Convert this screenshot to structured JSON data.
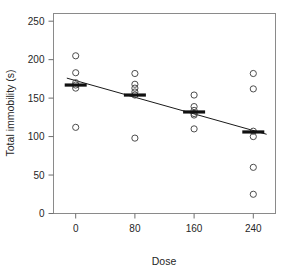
{
  "chart_data": {
    "type": "scatter",
    "title": "",
    "xlabel": "Dose",
    "ylabel": "Total immobility (s)",
    "xlim": [
      -30,
      270
    ],
    "ylim": [
      0,
      260
    ],
    "xticks": [
      0,
      80,
      160,
      240
    ],
    "yticks": [
      0,
      50,
      100,
      150,
      200,
      250
    ],
    "xtick_labels": [
      "0",
      "80",
      "160",
      "240"
    ],
    "ytick_labels": [
      "0",
      "50",
      "100",
      "150",
      "200",
      "250"
    ],
    "grid": false,
    "legend": false,
    "frame": "box",
    "categories": [
      0,
      80,
      160,
      240
    ],
    "series": [
      {
        "name": "Total immobility observations",
        "marker": "open-circle",
        "points": [
          {
            "x": 0,
            "y": 205
          },
          {
            "x": 0,
            "y": 183
          },
          {
            "x": 0,
            "y": 170
          },
          {
            "x": 0,
            "y": 167
          },
          {
            "x": 0,
            "y": 163
          },
          {
            "x": 0,
            "y": 112
          },
          {
            "x": 80,
            "y": 182
          },
          {
            "x": 80,
            "y": 168
          },
          {
            "x": 80,
            "y": 163
          },
          {
            "x": 80,
            "y": 158
          },
          {
            "x": 80,
            "y": 154
          },
          {
            "x": 80,
            "y": 98
          },
          {
            "x": 160,
            "y": 154
          },
          {
            "x": 160,
            "y": 139
          },
          {
            "x": 160,
            "y": 134
          },
          {
            "x": 160,
            "y": 130
          },
          {
            "x": 160,
            "y": 128
          },
          {
            "x": 160,
            "y": 110
          },
          {
            "x": 240,
            "y": 182
          },
          {
            "x": 240,
            "y": 162
          },
          {
            "x": 240,
            "y": 107
          },
          {
            "x": 240,
            "y": 100
          },
          {
            "x": 240,
            "y": 60
          },
          {
            "x": 240,
            "y": 25
          }
        ]
      },
      {
        "name": "Group means",
        "marker": "horizontal-bar",
        "points": [
          {
            "x": 0,
            "y": 167
          },
          {
            "x": 80,
            "y": 154
          },
          {
            "x": 160,
            "y": 132
          },
          {
            "x": 240,
            "y": 106
          }
        ]
      }
    ],
    "fit_line": {
      "name": "Linear regression fit",
      "x_start": -12,
      "y_start": 176,
      "x_end": 258,
      "y_end": 103
    },
    "colors": {
      "point_stroke": "#4d4d4d",
      "mean_bar": "#111111",
      "fit_line": "#1a1a1a",
      "frame": "#8a8a8a",
      "text": "#262626",
      "background": "#ffffff"
    }
  }
}
